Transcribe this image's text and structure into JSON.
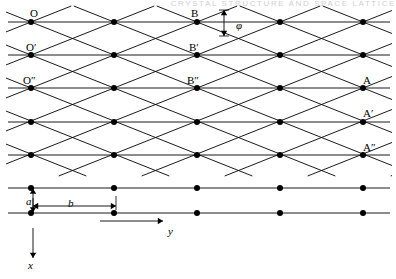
{
  "figure": {
    "kind": "crystal-lattice-diagram",
    "running_head": "CRYSTAL STRUCTURE AND SPACE LATTICE",
    "background": "#ffffff",
    "ink": "#000000",
    "width": 396,
    "height": 279,
    "labels": {
      "origin": "O",
      "origin_prime": "O′",
      "origin_double_prime": "O″",
      "b_point": "B",
      "b_prime": "B′",
      "b_double_prime": "B″",
      "a_point": "A",
      "a_prime": "A′",
      "a_double_prime": "A″",
      "angle": "φ",
      "spacing_a": "a",
      "spacing_b": "b",
      "axis_y": "y",
      "axis_x": "x"
    },
    "label_positions": [
      {
        "key": "origin",
        "text": "O",
        "x": 30,
        "y": 8,
        "italic": false
      },
      {
        "key": "origin_prime",
        "text": "O′",
        "x": 26,
        "y": 42,
        "italic": false
      },
      {
        "key": "origin_double_prime",
        "text": "O″",
        "x": 23,
        "y": 75,
        "italic": false
      },
      {
        "key": "b_point",
        "text": "B",
        "x": 191,
        "y": 8,
        "italic": false
      },
      {
        "key": "b_prime",
        "text": "B′",
        "x": 189,
        "y": 42,
        "italic": false
      },
      {
        "key": "b_double_prime",
        "text": "B″",
        "x": 187,
        "y": 75,
        "italic": false
      },
      {
        "key": "a_point",
        "text": "A",
        "x": 363,
        "y": 75,
        "italic": false
      },
      {
        "key": "a_prime",
        "text": "A′",
        "x": 363,
        "y": 108,
        "italic": false
      },
      {
        "key": "a_double_prime",
        "text": "A″",
        "x": 363,
        "y": 142,
        "italic": false
      },
      {
        "key": "angle",
        "text": "φ",
        "x": 236,
        "y": 20,
        "italic": true
      },
      {
        "key": "spacing_a",
        "text": "a",
        "x": 26,
        "y": 196,
        "italic": true
      },
      {
        "key": "spacing_b",
        "text": "b",
        "x": 68,
        "y": 198,
        "italic": true
      },
      {
        "key": "axis_y",
        "text": "y",
        "x": 168,
        "y": 226,
        "italic": true
      },
      {
        "key": "axis_x",
        "text": "x",
        "x": 28,
        "y": 260,
        "italic": true
      }
    ],
    "geometry": {
      "dot_radius": 3.0,
      "row_y": [
        22,
        55,
        88,
        122,
        155,
        188,
        213
      ],
      "dot_x": [
        31,
        114,
        197,
        280,
        363
      ],
      "col_spacing_b": 83,
      "row_spacing_a": 33,
      "lattice_rows_with_diagonals": [
        22,
        55,
        88,
        122,
        155
      ],
      "plain_rows": [
        188,
        213
      ],
      "line_width": 0.9,
      "row_line_x_start": 8,
      "row_line_x_end": 390,
      "diagonal_family_down": {
        "description": "lines descending left-to-right through lattice points",
        "dx": 83,
        "dy": 33
      },
      "diagonal_family_up": {
        "description": "lines ascending left-to-right through lattice points",
        "dx": 83,
        "dy": -33
      }
    },
    "annotations": {
      "angle_marker": {
        "label": "φ",
        "x": 224,
        "y_top": 10,
        "y_bottom": 36,
        "description": "vertical double-headed arrow between two diagonals at B"
      },
      "a_marker": {
        "label": "a",
        "x": 33,
        "y_top": 188,
        "y_bottom": 213,
        "description": "vertical double-headed arrow showing row spacing a"
      },
      "b_marker": {
        "label": "b",
        "y": 206,
        "x_left": 33,
        "x_right": 116,
        "description": "horizontal double-headed arrow showing column spacing b"
      },
      "y_axis": {
        "label": "y",
        "x_start": 100,
        "x_end": 163,
        "y": 221,
        "direction": "right"
      },
      "x_axis": {
        "label": "x",
        "x": 33,
        "y_start": 228,
        "y_end": 258,
        "direction": "down"
      }
    }
  }
}
